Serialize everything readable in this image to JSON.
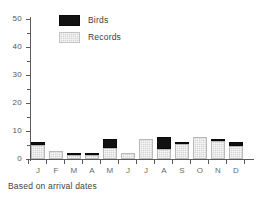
{
  "chart_data": {
    "type": "bar",
    "stacked": true,
    "title": "",
    "subtitle": "",
    "xlabel": "",
    "ylabel": "",
    "categories": [
      "J",
      "F",
      "M",
      "A",
      "M",
      "J",
      "J",
      "A",
      "S",
      "O",
      "N",
      "D"
    ],
    "series": [
      {
        "name": "Records",
        "color": "#d4d4d4",
        "values": [
          5,
          3,
          1.5,
          1.5,
          4,
          2,
          7,
          3.5,
          5.5,
          8,
          6.5,
          4.5
        ]
      },
      {
        "name": "Birds",
        "color": "#121212",
        "values": [
          1,
          0,
          0.6,
          0.6,
          3,
          0,
          0,
          4.5,
          0.6,
          0,
          0.7,
          1.5
        ]
      }
    ],
    "totals": [
      6,
      3,
      2.1,
      2.1,
      7,
      2,
      7,
      8,
      6.1,
      8,
      7.2,
      6
    ],
    "ylim": [
      0,
      50
    ],
    "yticks": [
      0,
      10,
      20,
      30,
      40,
      50
    ],
    "yticklabels": [
      "0",
      "10",
      "20",
      "30",
      "40",
      "50"
    ],
    "yminorticks": [
      5,
      15,
      25,
      35,
      45
    ],
    "grid": false,
    "legend_position": "top-left",
    "annotations": [
      "Based on arrival dates"
    ]
  },
  "legend": {
    "items": [
      {
        "label": "Birds",
        "swatch": "black-swatch-icon"
      },
      {
        "label": "Records",
        "swatch": "gray-swatch-icon"
      }
    ]
  },
  "caption": {
    "text": "Based on arrival dates"
  }
}
